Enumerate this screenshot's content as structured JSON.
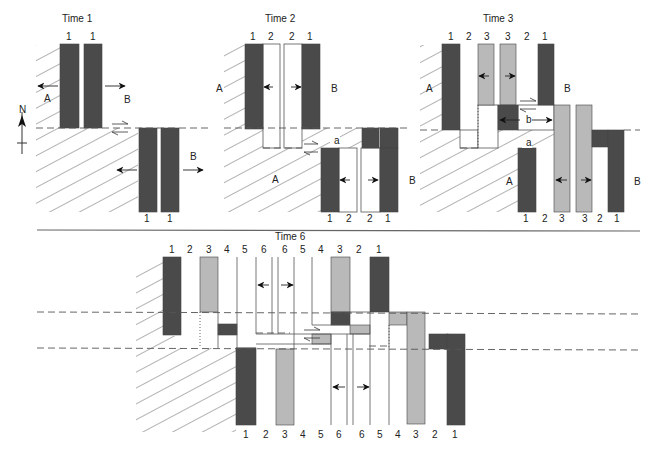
{
  "figure": {
    "type": "diagram",
    "colors": {
      "dark_stripe": "#4a4a4a",
      "light_stripe": "#b9b9b9",
      "line": "#555555",
      "hatch": "#555555",
      "background": "#ffffff"
    },
    "compass": {
      "label": "N",
      "x": 22,
      "y": 118
    },
    "panels": [
      {
        "id": "time1",
        "title": "Time 1",
        "title_pos": [
          62,
          22
        ],
        "top_numbers": [
          {
            "t": "1",
            "x": 69
          },
          {
            "t": "1",
            "x": 93
          }
        ],
        "bottom_numbers": [
          {
            "t": "1",
            "x": 147
          },
          {
            "t": "1",
            "x": 170
          }
        ],
        "plate_labels": [
          {
            "t": "A",
            "x": 44,
            "y": 102
          },
          {
            "t": "B",
            "x": 124,
            "y": 103
          },
          {
            "t": "B",
            "x": 190,
            "y": 160
          }
        ],
        "hatch_polys": [
          "36,45 60,45 60,128 138,128 138,212 36,212"
        ],
        "bars": [
          {
            "x": 60,
            "y": 44,
            "w": 19,
            "h": 84,
            "c": "dark"
          },
          {
            "x": 84,
            "y": 44,
            "w": 18,
            "h": 84,
            "c": "dark"
          },
          {
            "x": 139,
            "y": 128,
            "w": 18,
            "h": 84,
            "c": "dark"
          },
          {
            "x": 161,
            "y": 128,
            "w": 18,
            "h": 84,
            "c": "dark"
          }
        ],
        "dashed": [
          {
            "x1": 36,
            "y1": 128,
            "x2": 208,
            "y2": 128
          }
        ],
        "arrows": [
          {
            "x1": 58,
            "y1": 86,
            "x2": 38,
            "y2": 86,
            "head": "solid"
          },
          {
            "x1": 105,
            "y1": 86,
            "x2": 125,
            "y2": 86,
            "head": "solid"
          },
          {
            "x1": 137,
            "y1": 170,
            "x2": 117,
            "y2": 170,
            "head": "solid"
          },
          {
            "x1": 183,
            "y1": 170,
            "x2": 203,
            "y2": 170,
            "head": "solid"
          }
        ],
        "half_arrows": [
          {
            "x1": 112,
            "y1": 124,
            "x2": 128,
            "y2": 124,
            "dir": "right"
          },
          {
            "x1": 128,
            "y1": 132,
            "x2": 112,
            "y2": 132,
            "dir": "left"
          }
        ]
      },
      {
        "id": "time2",
        "title": "Time 2",
        "title_pos": [
          265,
          22
        ],
        "top_numbers": [
          {
            "t": "1",
            "x": 253
          },
          {
            "t": "2",
            "x": 271
          },
          {
            "t": "2",
            "x": 292
          },
          {
            "t": "1",
            "x": 310
          }
        ],
        "bottom_numbers": [
          {
            "t": "1",
            "x": 330
          },
          {
            "t": "2",
            "x": 349
          },
          {
            "t": "2",
            "x": 370
          },
          {
            "t": "1",
            "x": 388
          }
        ],
        "plate_labels": [
          {
            "t": "A",
            "x": 216,
            "y": 92
          },
          {
            "t": "B",
            "x": 331,
            "y": 92
          },
          {
            "t": "A",
            "x": 272,
            "y": 183
          },
          {
            "t": "a",
            "x": 334,
            "y": 144
          },
          {
            "t": "B",
            "x": 409,
            "y": 184
          }
        ],
        "hatch_polys": [
          "224,45 245,45 245,128 263,128 263,148 321,148 321,212 224,212",
          "302,128 362,128 362,148 302,148"
        ],
        "bars": [
          {
            "x": 245,
            "y": 44,
            "w": 18,
            "h": 85,
            "c": "dark"
          },
          {
            "x": 302,
            "y": 44,
            "w": 18,
            "h": 85,
            "c": "dark"
          },
          {
            "x": 362,
            "y": 128,
            "w": 17,
            "h": 20,
            "c": "dark"
          },
          {
            "x": 380,
            "y": 128,
            "w": 18,
            "h": 20,
            "c": "dark"
          },
          {
            "x": 321,
            "y": 148,
            "w": 18,
            "h": 64,
            "c": "dark"
          },
          {
            "x": 380,
            "y": 148,
            "w": 18,
            "h": 64,
            "c": "dark"
          }
        ],
        "white_boxes": [
          {
            "x": 263,
            "y": 44,
            "w": 17,
            "h": 104
          },
          {
            "x": 284,
            "y": 44,
            "w": 18,
            "h": 104
          },
          {
            "x": 339,
            "y": 148,
            "w": 18,
            "h": 64
          },
          {
            "x": 361,
            "y": 148,
            "w": 19,
            "h": 64
          }
        ],
        "dashed": [
          {
            "x1": 224,
            "y1": 128,
            "x2": 410,
            "y2": 128
          },
          {
            "x1": 263,
            "y1": 148,
            "x2": 302,
            "y2": 148
          }
        ],
        "arrows": [
          {
            "x1": 273,
            "y1": 87,
            "x2": 264,
            "y2": 87,
            "head": "solid"
          },
          {
            "x1": 291,
            "y1": 87,
            "x2": 301,
            "y2": 87,
            "head": "solid"
          },
          {
            "x1": 350,
            "y1": 180,
            "x2": 340,
            "y2": 180,
            "head": "solid"
          },
          {
            "x1": 368,
            "y1": 180,
            "x2": 378,
            "y2": 180,
            "head": "solid"
          }
        ],
        "half_arrows": [
          {
            "x1": 304,
            "y1": 144,
            "x2": 318,
            "y2": 144,
            "dir": "right"
          },
          {
            "x1": 318,
            "y1": 152,
            "x2": 304,
            "y2": 152,
            "dir": "left"
          }
        ]
      },
      {
        "id": "time3",
        "title": "Time 3",
        "title_pos": [
          483,
          22
        ],
        "top_numbers": [
          {
            "t": "1",
            "x": 451
          },
          {
            "t": "2",
            "x": 469
          },
          {
            "t": "3",
            "x": 487
          },
          {
            "t": "3",
            "x": 508
          },
          {
            "t": "2",
            "x": 527
          },
          {
            "t": "1",
            "x": 545
          }
        ],
        "bottom_numbers": [
          {
            "t": "1",
            "x": 526
          },
          {
            "t": "2",
            "x": 545
          },
          {
            "t": "3",
            "x": 562
          },
          {
            "t": "3",
            "x": 585
          },
          {
            "t": "2",
            "x": 600
          },
          {
            "t": "1",
            "x": 617
          }
        ],
        "plate_labels": [
          {
            "t": "A",
            "x": 426,
            "y": 92
          },
          {
            "t": "B",
            "x": 564,
            "y": 92
          },
          {
            "t": "b",
            "x": 526,
            "y": 123
          },
          {
            "t": "a",
            "x": 526,
            "y": 146
          },
          {
            "t": "A",
            "x": 506,
            "y": 185
          },
          {
            "t": "B",
            "x": 634,
            "y": 185
          }
        ],
        "hatch_polys": [
          "420,45 442,45 442,130 460,130 460,148 518,148 518,212 420,212",
          "498,130 555,130 555,148 498,148"
        ],
        "bars": [
          {
            "x": 442,
            "y": 44,
            "w": 18,
            "h": 86,
            "c": "dark"
          },
          {
            "x": 478,
            "y": 44,
            "w": 16,
            "h": 61,
            "c": "light"
          },
          {
            "x": 500,
            "y": 44,
            "w": 16,
            "h": 61,
            "c": "light"
          },
          {
            "x": 538,
            "y": 44,
            "w": 16,
            "h": 61,
            "c": "dark"
          },
          {
            "x": 498,
            "y": 105,
            "w": 20,
            "h": 25,
            "c": "dark"
          },
          {
            "x": 554,
            "y": 105,
            "w": 16,
            "h": 107,
            "c": "light"
          },
          {
            "x": 576,
            "y": 105,
            "w": 16,
            "h": 107,
            "c": "light"
          },
          {
            "x": 592,
            "y": 130,
            "w": 16,
            "h": 17,
            "c": "dark"
          },
          {
            "x": 608,
            "y": 130,
            "w": 16,
            "h": 82,
            "c": "dark"
          },
          {
            "x": 518,
            "y": 148,
            "w": 18,
            "h": 64,
            "c": "dark"
          }
        ],
        "white_boxes": [
          {
            "x": 460,
            "y": 130,
            "w": 18,
            "h": 18
          },
          {
            "x": 478,
            "y": 105,
            "w": 20,
            "h": 43
          },
          {
            "x": 518,
            "y": 105,
            "w": 36,
            "h": 25
          }
        ],
        "dotted": [
          {
            "x1": 478,
            "y1": 105,
            "x2": 478,
            "y2": 148
          }
        ],
        "dashed": [
          {
            "x1": 420,
            "y1": 130,
            "x2": 442,
            "y2": 130
          },
          {
            "x1": 624,
            "y1": 130,
            "x2": 640,
            "y2": 130
          },
          {
            "x1": 460,
            "y1": 148,
            "x2": 478,
            "y2": 148
          }
        ],
        "arrows": [
          {
            "x1": 489,
            "y1": 76,
            "x2": 479,
            "y2": 76,
            "head": "solid"
          },
          {
            "x1": 505,
            "y1": 76,
            "x2": 515,
            "y2": 76,
            "head": "solid"
          },
          {
            "x1": 520,
            "y1": 120,
            "x2": 500,
            "y2": 120,
            "head": "solid"
          },
          {
            "x1": 532,
            "y1": 120,
            "x2": 552,
            "y2": 120,
            "head": "solid"
          },
          {
            "x1": 567,
            "y1": 180,
            "x2": 556,
            "y2": 180,
            "head": "solid"
          },
          {
            "x1": 581,
            "y1": 180,
            "x2": 591,
            "y2": 180,
            "head": "solid"
          }
        ],
        "half_arrows": [
          {
            "x1": 520,
            "y1": 101,
            "x2": 536,
            "y2": 101,
            "dir": "right"
          },
          {
            "x1": 536,
            "y1": 109,
            "x2": 520,
            "y2": 109,
            "dir": "left"
          }
        ]
      },
      {
        "id": "time6",
        "title": "Time 6",
        "title_pos": [
          275,
          240
        ],
        "top_numbers": [
          {
            "t": "1",
            "x": 172
          },
          {
            "t": "2",
            "x": 190
          },
          {
            "t": "3",
            "x": 209
          },
          {
            "t": "4",
            "x": 227
          },
          {
            "t": "5",
            "x": 245
          },
          {
            "t": "6",
            "x": 264
          },
          {
            "t": "6",
            "x": 285
          },
          {
            "t": "5",
            "x": 303
          },
          {
            "t": "4",
            "x": 321
          },
          {
            "t": "3",
            "x": 340
          },
          {
            "t": "2",
            "x": 359
          },
          {
            "t": "1",
            "x": 379
          }
        ],
        "bottom_numbers": [
          {
            "t": "1",
            "x": 246
          },
          {
            "t": "2",
            "x": 266
          },
          {
            "t": "3",
            "x": 285
          },
          {
            "t": "4",
            "x": 303
          },
          {
            "t": "5",
            "x": 321
          },
          {
            "t": "6",
            "x": 339
          },
          {
            "t": "6",
            "x": 362
          },
          {
            "t": "5",
            "x": 380
          },
          {
            "t": "4",
            "x": 398
          },
          {
            "t": "3",
            "x": 416
          },
          {
            "t": "2",
            "x": 435
          },
          {
            "t": "1",
            "x": 455
          }
        ],
        "hatch_polys": [
          "136,265 163,257 163,336 181,336 181,348 236,348 236,432 136,432"
        ],
        "bars": [
          {
            "x": 163,
            "y": 257,
            "w": 18,
            "h": 78,
            "c": "dark"
          },
          {
            "x": 200,
            "y": 257,
            "w": 18,
            "h": 55,
            "c": "light"
          },
          {
            "x": 218,
            "y": 324,
            "w": 19,
            "h": 11,
            "c": "dark"
          },
          {
            "x": 331,
            "y": 257,
            "w": 19,
            "h": 56,
            "c": "light"
          },
          {
            "x": 331,
            "y": 312,
            "w": 19,
            "h": 13,
            "c": "dark"
          },
          {
            "x": 370,
            "y": 257,
            "w": 19,
            "h": 55,
            "c": "dark"
          },
          {
            "x": 350,
            "y": 325,
            "w": 20,
            "h": 9,
            "c": "light"
          },
          {
            "x": 389,
            "y": 312,
            "w": 18,
            "h": 13,
            "c": "light"
          },
          {
            "x": 407,
            "y": 312,
            "w": 18,
            "h": 112,
            "c": "light"
          },
          {
            "x": 312,
            "y": 334,
            "w": 19,
            "h": 10,
            "c": "light"
          },
          {
            "x": 429,
            "y": 334,
            "w": 19,
            "h": 15,
            "c": "dark"
          },
          {
            "x": 447,
            "y": 334,
            "w": 18,
            "h": 91,
            "c": "dark"
          },
          {
            "x": 236,
            "y": 348,
            "w": 20,
            "h": 77,
            "c": "dark"
          },
          {
            "x": 276,
            "y": 349,
            "w": 18,
            "h": 76,
            "c": "light"
          }
        ],
        "vlines": [
          {
            "x": 237,
            "y1": 257,
            "y2": 348
          },
          {
            "x": 256,
            "y1": 257,
            "y2": 334
          },
          {
            "x": 272,
            "y1": 257,
            "y2": 334
          },
          {
            "x": 278,
            "y1": 257,
            "y2": 334
          },
          {
            "x": 294,
            "y1": 257,
            "y2": 349
          },
          {
            "x": 312,
            "y1": 257,
            "y2": 325
          },
          {
            "x": 331,
            "y1": 334,
            "y2": 425
          },
          {
            "x": 347,
            "y1": 334,
            "y2": 425
          },
          {
            "x": 353,
            "y1": 334,
            "y2": 425
          },
          {
            "x": 370,
            "y1": 312,
            "y2": 425
          },
          {
            "x": 389,
            "y1": 325,
            "y2": 425
          },
          {
            "x": 218,
            "y1": 312,
            "y2": 348
          }
        ],
        "hlines": [
          {
            "x1": 312,
            "y1": 325,
            "x2": 350,
            "y2": 325
          },
          {
            "x1": 256,
            "y1": 334,
            "x2": 370,
            "y2": 334
          },
          {
            "x1": 256,
            "y1": 344,
            "x2": 331,
            "y2": 344
          },
          {
            "x1": 331,
            "y1": 312,
            "x2": 370,
            "y2": 312
          },
          {
            "x1": 236,
            "y1": 348,
            "x2": 256,
            "y2": 348
          }
        ],
        "dotted": [
          {
            "x1": 200,
            "y1": 312,
            "x2": 200,
            "y2": 348
          },
          {
            "x1": 389,
            "y1": 325,
            "x2": 389,
            "y2": 348
          }
        ],
        "dashed": [
          {
            "x1": 37,
            "y1": 312,
            "x2": 642,
            "y2": 314
          },
          {
            "x1": 37,
            "y1": 348,
            "x2": 642,
            "y2": 350
          },
          {
            "x1": 256,
            "y1": 333,
            "x2": 290,
            "y2": 333
          },
          {
            "x1": 369,
            "y1": 346,
            "x2": 389,
            "y2": 346
          }
        ],
        "arrows": [
          {
            "x1": 269,
            "y1": 285,
            "x2": 258,
            "y2": 285,
            "head": "solid"
          },
          {
            "x1": 281,
            "y1": 285,
            "x2": 293,
            "y2": 285,
            "head": "solid"
          },
          {
            "x1": 345,
            "y1": 387,
            "x2": 333,
            "y2": 387,
            "head": "solid"
          },
          {
            "x1": 357,
            "y1": 387,
            "x2": 369,
            "y2": 387,
            "head": "solid"
          }
        ],
        "half_arrows": [
          {
            "x1": 304,
            "y1": 330,
            "x2": 320,
            "y2": 330,
            "dir": "right"
          },
          {
            "x1": 320,
            "y1": 338,
            "x2": 304,
            "y2": 338,
            "dir": "left"
          }
        ]
      }
    ],
    "divider": {
      "x1": 37,
      "y1": 230,
      "x2": 640,
      "y2": 231
    },
    "caption": {
      "text": "",
      "note": "caption text cut off at bottom edge; not legible"
    }
  }
}
